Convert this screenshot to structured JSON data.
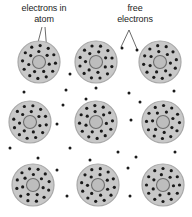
{
  "figure": {
    "background_color": "#ffffff"
  },
  "labels": {
    "electrons_in_atom": "electrons in\natom",
    "free_electrons": "free\nelectrons"
  },
  "style": {
    "atom_fill": "#c8c8c8",
    "atom_stroke": "#a8a8a8",
    "nucleus_fill": "#bdbdbd",
    "nucleus_stroke": "#6e6e6e",
    "electron_color": "#1a1a1a",
    "leader_color": "#2b2b2b",
    "text_color": "#1c1c1c"
  },
  "chart_data": {
    "type": "scatter",
    "atom_radius": 21,
    "nucleus_radius": 6.5,
    "electron_radius": 1.6,
    "free_electron_radius": 1.5,
    "inner_ring_radius": 10.5,
    "outer_ring_radius": 16.5,
    "inner_ring_count": 7,
    "outer_ring_count": 12,
    "atoms": [
      {
        "id": "atom-r1c1",
        "cx": 39,
        "cy": 62,
        "inner_rotation": 12,
        "outer_rotation": 4
      },
      {
        "id": "atom-r1c2",
        "cx": 96,
        "cy": 62,
        "inner_rotation": 28,
        "outer_rotation": 16
      },
      {
        "id": "atom-r1c3",
        "cx": 160,
        "cy": 62,
        "inner_rotation": 6,
        "outer_rotation": 22
      },
      {
        "id": "atom-r2c1",
        "cx": 30,
        "cy": 122,
        "inner_rotation": 20,
        "outer_rotation": 10
      },
      {
        "id": "atom-r2c2",
        "cx": 96,
        "cy": 122,
        "inner_rotation": 8,
        "outer_rotation": 26
      },
      {
        "id": "atom-r2c3",
        "cx": 163,
        "cy": 122,
        "inner_rotation": 32,
        "outer_rotation": 2
      },
      {
        "id": "atom-r3c1",
        "cx": 33,
        "cy": 185,
        "inner_rotation": 15,
        "outer_rotation": 18
      },
      {
        "id": "atom-r3c2",
        "cx": 98,
        "cy": 185,
        "inner_rotation": 24,
        "outer_rotation": 8
      },
      {
        "id": "atom-r3c3",
        "cx": 163,
        "cy": 185,
        "inner_rotation": 4,
        "outer_rotation": 30
      }
    ],
    "free_electrons": [
      {
        "x": 70,
        "y": 74
      },
      {
        "x": 122,
        "y": 48
      },
      {
        "x": 137,
        "y": 50
      },
      {
        "x": 24,
        "y": 92
      },
      {
        "x": 66,
        "y": 90
      },
      {
        "x": 96,
        "y": 88
      },
      {
        "x": 129,
        "y": 93
      },
      {
        "x": 86,
        "y": 99
      },
      {
        "x": 63,
        "y": 105
      },
      {
        "x": 140,
        "y": 102
      },
      {
        "x": 174,
        "y": 91
      },
      {
        "x": 57,
        "y": 124
      },
      {
        "x": 131,
        "y": 120
      },
      {
        "x": 70,
        "y": 148
      },
      {
        "x": 118,
        "y": 152
      },
      {
        "x": 38,
        "y": 158
      },
      {
        "x": 90,
        "y": 160
      },
      {
        "x": 136,
        "y": 157
      },
      {
        "x": 175,
        "y": 152
      },
      {
        "x": 57,
        "y": 170
      },
      {
        "x": 128,
        "y": 168
      },
      {
        "x": 67,
        "y": 196
      },
      {
        "x": 130,
        "y": 196
      },
      {
        "x": 10,
        "y": 148
      }
    ],
    "leaders": [
      {
        "name": "leader-atom-electron-a",
        "x1": 42,
        "y1": 27,
        "x2": 36,
        "y2": 50
      },
      {
        "name": "leader-atom-electron-b",
        "x1": 45,
        "y1": 27,
        "x2": 47,
        "y2": 52
      },
      {
        "name": "leader-free-electron-left",
        "x1": 129,
        "y1": 30,
        "x2": 121,
        "y2": 47
      },
      {
        "name": "leader-free-electron-right",
        "x1": 129,
        "y1": 30,
        "x2": 137,
        "y2": 49
      }
    ]
  }
}
